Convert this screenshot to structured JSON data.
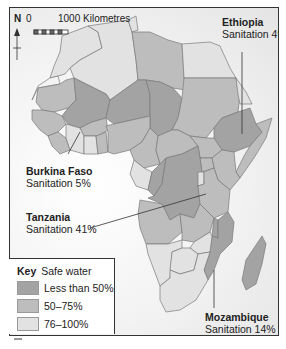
{
  "map": {
    "scale": {
      "start": "0",
      "end_label": "1000 Kilometres"
    },
    "north_label": "N",
    "colors": {
      "less_than_50": "#a3a3a3",
      "between_50_75": "#bdbdbd",
      "between_76_100": "#e2e2e2",
      "border": "#7a7a7a",
      "leader": "#333333"
    },
    "callouts": [
      {
        "country": "Ethiopia",
        "sanitation": "Sanitation 4%"
      },
      {
        "country": "Burkina Faso",
        "sanitation": "Sanitation 5%"
      },
      {
        "country": "Tanzania",
        "sanitation": "Sanitation 41%"
      },
      {
        "country": "Mozambique",
        "sanitation": "Sanitation 14%"
      }
    ],
    "key": {
      "heading": "Key",
      "subtitle": "Safe water",
      "items": [
        {
          "label": "Less than 50%",
          "color": "#a3a3a3"
        },
        {
          "label": "50–75%",
          "color": "#bdbdbd"
        },
        {
          "label": "76–100%",
          "color": "#e2e2e2"
        }
      ]
    }
  }
}
